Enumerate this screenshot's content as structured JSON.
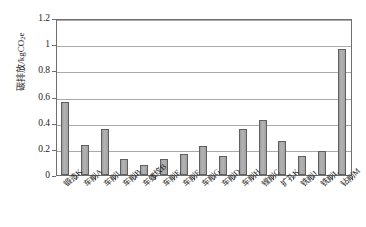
{
  "chart_data": {
    "type": "bar",
    "title": "",
    "xlabel": "",
    "ylabel": "碳排放/kgCO₂e",
    "ylabel_main": "碳排放/kgCO",
    "ylabel_sub": "2",
    "ylabel_tail": "e",
    "ylim": [
      0,
      1.2
    ],
    "grid": true,
    "legend": "none",
    "ytick_labels": [
      "1.2",
      "1",
      "0.8",
      "0.6",
      "0.4",
      "0.2",
      "0"
    ],
    "ytick_values": [
      1.2,
      1.0,
      0.8,
      0.6,
      0.4,
      0.2,
      0
    ],
    "categories": [
      "锻造K",
      "车削A",
      "车削I",
      "车削B",
      "车螺纹B",
      "车削E",
      "车削F",
      "车削G",
      "车削D",
      "车削H",
      "镗削C",
      "扩孔K",
      "铣削J",
      "铣削L",
      "钻削M"
    ],
    "values": [
      0.555,
      0.23,
      0.355,
      0.12,
      0.08,
      0.12,
      0.16,
      0.225,
      0.145,
      0.355,
      0.42,
      0.26,
      0.145,
      0.18,
      0.96
    ],
    "series": [
      {
        "name": "碳排放",
        "values": [
          0.555,
          0.23,
          0.355,
          0.12,
          0.08,
          0.12,
          0.16,
          0.225,
          0.145,
          0.355,
          0.42,
          0.26,
          0.145,
          0.18,
          0.96
        ]
      }
    ],
    "colors": {
      "bar_fill": "#a9a9a9",
      "bar_edge": "#5f5f5f",
      "gridline": "#a9a9a9",
      "axis": "#6f6f6f",
      "text": "#1b1b1b",
      "background": "#ffffff"
    }
  }
}
